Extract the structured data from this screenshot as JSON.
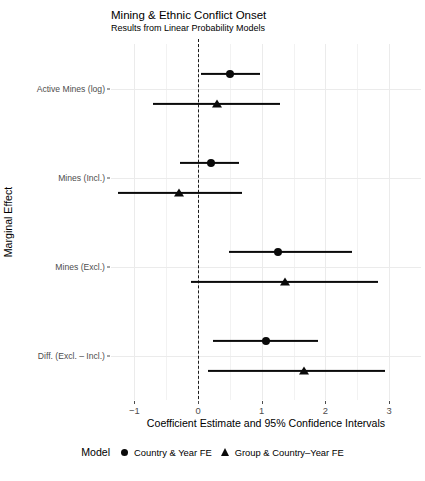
{
  "chart_data": {
    "type": "scatter",
    "title": "Mining & Ethnic Conflict Onset",
    "subtitle": "Results from Linear Probability Models",
    "xlabel": "Coefficient Estimate and 95% Confidence Intervals",
    "ylabel": "Marginal Effect",
    "xlim": [
      -1.35,
      3.2
    ],
    "xticks": [
      -1,
      0,
      1,
      2,
      3
    ],
    "xticklabels": [
      "−1",
      "0",
      "1",
      "2",
      "3"
    ],
    "categories": [
      "Active Mines (log)",
      "Mines (Incl.)",
      "Mines (Excl.)",
      "Diff. (Excl. – Incl.)"
    ],
    "grid": true,
    "reference_line": 0,
    "legend_title": "Model",
    "legend_position": "bottom",
    "series": [
      {
        "name": "Country & Year FE",
        "marker": "circle",
        "points": [
          {
            "category": "Active Mines (log)",
            "estimate": 0.51,
            "ci_low": 0.04,
            "ci_high": 0.97
          },
          {
            "category": "Mines (Incl.)",
            "estimate": 0.2,
            "ci_low": -0.29,
            "ci_high": 0.65
          },
          {
            "category": "Mines (Excl.)",
            "estimate": 1.26,
            "ci_low": 0.49,
            "ci_high": 2.41
          },
          {
            "category": "Diff. (Excl. – Incl.)",
            "estimate": 1.07,
            "ci_low": 0.24,
            "ci_high": 1.89
          }
        ]
      },
      {
        "name": "Group & Country–Year FE",
        "marker": "triangle",
        "points": [
          {
            "category": "Active Mines (log)",
            "estimate": 0.3,
            "ci_low": -0.7,
            "ci_high": 1.29
          },
          {
            "category": "Mines (Incl.)",
            "estimate": -0.3,
            "ci_low": -1.25,
            "ci_high": 0.69
          },
          {
            "category": "Mines (Excl.)",
            "estimate": 1.37,
            "ci_low": -0.11,
            "ci_high": 2.82
          },
          {
            "category": "Diff. (Excl. – Incl.)",
            "estimate": 1.66,
            "ci_low": 0.15,
            "ci_high": 2.94
          }
        ]
      }
    ]
  }
}
